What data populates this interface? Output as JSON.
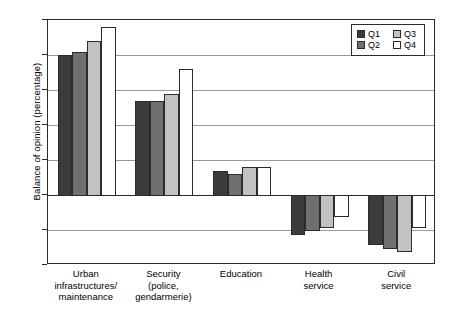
{
  "chart_data": {
    "type": "bar",
    "title": "",
    "subtitle": "",
    "xlabel": "",
    "ylabel": "Balance of opinion (percentage)",
    "categories": [
      "Urban\ninfrastructures/\nmaintenance",
      "Security\n(police,\ngendarmerie)",
      "Education",
      "Health\nservice",
      "Civil\nservice"
    ],
    "series": [
      {
        "name": "Q1",
        "color": "#3c3c3c",
        "values": [
          40,
          27,
          7,
          -11,
          -14
        ]
      },
      {
        "name": "Q2",
        "color": "#707070",
        "values": [
          41,
          27,
          6,
          -10,
          -15
        ]
      },
      {
        "name": "Q3",
        "color": "#c2c2c2",
        "values": [
          44,
          29,
          8,
          -9,
          -16
        ]
      },
      {
        "name": "Q4",
        "color": "#ffffff",
        "values": [
          48,
          36,
          8,
          -6,
          -9
        ]
      }
    ],
    "ylim": [
      -20,
      50
    ],
    "yticks": [
      50,
      40,
      30,
      20,
      10,
      0,
      -10,
      -20
    ],
    "ytick_labels": [
      "50",
      "40",
      "30",
      "20",
      "10",
      "0",
      "-10",
      "-20"
    ],
    "grid": true,
    "grid_axis": "y",
    "legend_position": "top-right",
    "legend_entries": [
      "Q1",
      "Q2",
      "Q3",
      "Q4"
    ],
    "bar_edge_color": "#2b2b2b",
    "axis_color": "#2b2b2b",
    "grid_color": "#9a9a9a"
  }
}
